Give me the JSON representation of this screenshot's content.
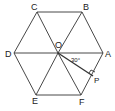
{
  "diagram": {
    "vertices": [
      {
        "label": "A",
        "x": 103,
        "y": 53
      },
      {
        "label": "B",
        "x": 82,
        "y": 12
      },
      {
        "label": "C",
        "x": 37,
        "y": 12
      },
      {
        "label": "D",
        "x": 14,
        "y": 53
      },
      {
        "label": "E",
        "x": 36,
        "y": 95
      },
      {
        "label": "F",
        "x": 81,
        "y": 95
      }
    ],
    "center": {
      "label": "O",
      "x": 58,
      "y": 53
    },
    "foot": {
      "label": "P",
      "x": 93,
      "y": 76
    },
    "angle_label": "30°",
    "right_angle_at": "P"
  }
}
